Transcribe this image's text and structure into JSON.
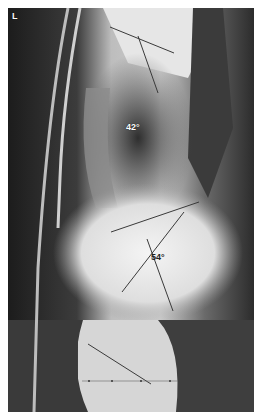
{
  "image": {
    "type": "lateral spine radiograph",
    "marker": "L"
  },
  "measurements": [
    {
      "name": "thoracic-kyphosis",
      "label": "42°"
    },
    {
      "name": "lumbar-lordosis",
      "label": "54°"
    }
  ],
  "colors": {
    "line": "#3a3a3a",
    "background": "#ffffff"
  }
}
